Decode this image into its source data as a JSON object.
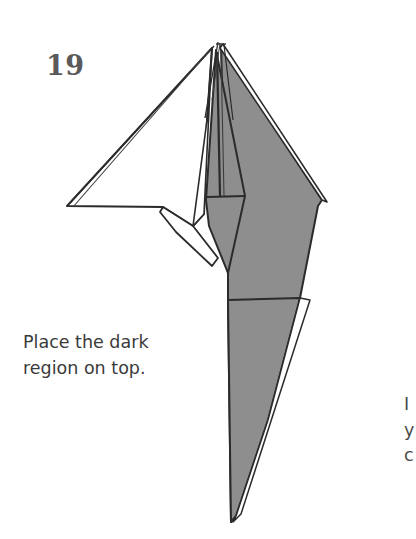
{
  "page": {
    "background_color": "#ffffff",
    "width": 416,
    "height": 539
  },
  "step": {
    "number": "19",
    "number_color": "#5a5a5a"
  },
  "caption": {
    "full_text": "Place the dark region on top.",
    "line1": "Place the dark",
    "line2": "region on top.",
    "color": "#3a3a3a"
  },
  "edge_column": {
    "line1": "I",
    "line2": "y",
    "line3": "c"
  },
  "diagram": {
    "colors": {
      "paper_front_white": "#ffffff",
      "paper_back_gray": "#8e8e8e",
      "paper_back_gray_shadow": "#7d7d7d",
      "outline": "#2b2b2b",
      "outline_thin": "#3c3c3c"
    },
    "stroke_widths": {
      "outline": 2.0,
      "crease": 1.5,
      "layer_line": 1.2
    },
    "key_points": {
      "apex": [
        218,
        42
      ],
      "left_wing_tip": [
        67,
        206
      ],
      "left_wing_base_right": [
        163,
        207
      ],
      "center_notch": [
        193,
        226
      ],
      "tie_bottom_point": [
        228,
        273
      ],
      "right_corner": [
        322,
        200
      ],
      "tail_point": [
        233,
        522
      ]
    }
  }
}
